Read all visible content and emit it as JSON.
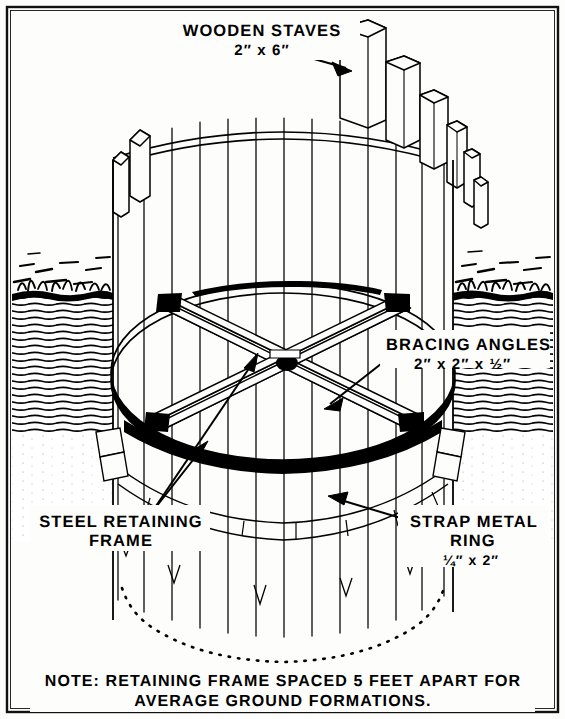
{
  "figure": {
    "title_note_line1": "NOTE:  RETAINING FRAME SPACED 5 FEET APART FOR",
    "title_note_line2": "AVERAGE GROUND FORMATIONS.",
    "border_color": "#111111",
    "ink_color": "#000000",
    "paper_color": "#fdfdfb"
  },
  "labels": {
    "wooden_staves": {
      "line1": "WOODEN STAVES",
      "line2": "2″ x 6″"
    },
    "bracing_angles": {
      "line1": "BRACING ANGLES",
      "line2": "2″ x 2″ x ½″"
    },
    "steel_retaining_frame": {
      "line1": "STEEL RETAINING",
      "line2": "FRAME"
    },
    "strap_metal_ring": {
      "line1": "STRAP METAL",
      "line2": "RING",
      "line3": "¼″ x 2″"
    }
  },
  "diagram": {
    "components": [
      "wooden staves",
      "strap metal ring",
      "bracing angles",
      "steel retaining frame",
      "ground formation hatching",
      "grass line"
    ]
  }
}
